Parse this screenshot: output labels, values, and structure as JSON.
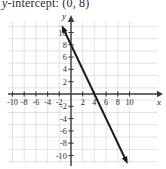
{
  "caption": {
    "text": "y-intercept: (0, 8)",
    "italic_prefix": "y",
    "rest": "-intercept: (0, 8)"
  },
  "chart_data": {
    "type": "line",
    "title": "",
    "xlabel": "x",
    "ylabel": "y",
    "xlim": [
      -11,
      11
    ],
    "ylim": [
      -11.5,
      11.5
    ],
    "grid": true,
    "grid_step": 2,
    "legend": "none",
    "x_ticks": [
      -10,
      -8,
      -6,
      -4,
      -2,
      2,
      4,
      6,
      8,
      10
    ],
    "x_tick_labels": [
      "-10",
      "-8",
      "-6",
      "-4",
      "-2",
      "2",
      "4",
      "6",
      "8",
      "10"
    ],
    "y_ticks": [
      10,
      8,
      6,
      4,
      2,
      -2,
      -4,
      -6,
      -8,
      -10
    ],
    "y_tick_labels": [
      "10",
      "8",
      "6",
      "4",
      "2",
      "-2",
      "-4",
      "-6",
      "-8",
      "-10"
    ],
    "series": [
      {
        "name": "line",
        "equation": "y = -2x + 8",
        "slope": -2,
        "y_intercept": 8,
        "x_intercept": 4,
        "arrow_start": true,
        "arrow_end": true,
        "points": [
          {
            "x": -1.6,
            "y": 11.2
          },
          {
            "x": 0,
            "y": 8
          },
          {
            "x": 4,
            "y": 0
          },
          {
            "x": 9.7,
            "y": -11.4
          }
        ]
      }
    ],
    "colors": {
      "line": "#1a1a1a",
      "axis": "#3a3a3a",
      "grid": "#cfcfd6",
      "background": "#ffffff",
      "text": "#2b2b2b"
    }
  }
}
